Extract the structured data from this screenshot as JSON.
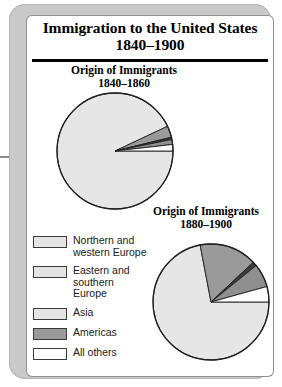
{
  "card": {
    "title_line1": "Immigration to the United States",
    "title_line2": "1840–1900"
  },
  "charts": [
    {
      "name": "immigration-1840-1860",
      "subtitle": "Origin of Immigrants\n1840–1860"
    },
    {
      "name": "immigration-1880-1900",
      "subtitle": "Origin of Immigrants\n1880–1900"
    }
  ],
  "legend": {
    "items": [
      {
        "label": "Northern and\nwestern Europe",
        "color": "#e4e4e4"
      },
      {
        "label": "Eastern and\nsouthern\nEurope",
        "color": "#e4e4e4"
      },
      {
        "label": "Asia",
        "color": "#e4e4e4"
      },
      {
        "label": "Americas",
        "color": "#9a9a9a"
      },
      {
        "label": "All others",
        "color": "#ffffff"
      }
    ]
  },
  "chart_data": [
    {
      "type": "pie",
      "title": "Origin of Immigrants 1840–1860",
      "categories": [
        "Northern and western Europe",
        "Eastern and southern Europe",
        "Asia",
        "Americas",
        "All others"
      ],
      "values": [
        93.0,
        3.2,
        0.6,
        1.4,
        1.8
      ],
      "unit": "percent",
      "start_angle_deg": 0,
      "direction": "clockwise",
      "colors": [
        "#e6e6e6",
        "#9a9a9a",
        "#3c3c3c",
        "#8f8f8f",
        "#ffffff"
      ],
      "legend_position": "bottom-left"
    },
    {
      "type": "pie",
      "title": "Origin of Immigrants 1880–1900",
      "categories": [
        "Northern and western Europe",
        "Eastern and southern Europe",
        "Asia",
        "Americas",
        "All others"
      ],
      "values": [
        72.0,
        16.0,
        1.2,
        6.5,
        4.3
      ],
      "unit": "percent",
      "start_angle_deg": 0,
      "direction": "clockwise",
      "colors": [
        "#e6e6e6",
        "#9a9a9a",
        "#3c3c3c",
        "#8f8f8f",
        "#ffffff"
      ],
      "legend_position": "bottom-left"
    }
  ]
}
